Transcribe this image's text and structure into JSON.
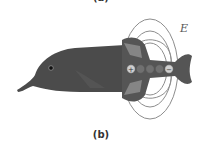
{
  "figure": {
    "top_label": "(a)",
    "caption": "(b)",
    "field_label": "E",
    "charges": [
      "+",
      "",
      "",
      "",
      "−"
    ],
    "colors": {
      "fish_body": "#4a4a4a",
      "fish_dark": "#3a3a3a",
      "field_lines": "#8a8a8a",
      "charge_fill": "#6e6e6e",
      "end_charge_fill": "#c8c8c8"
    }
  }
}
